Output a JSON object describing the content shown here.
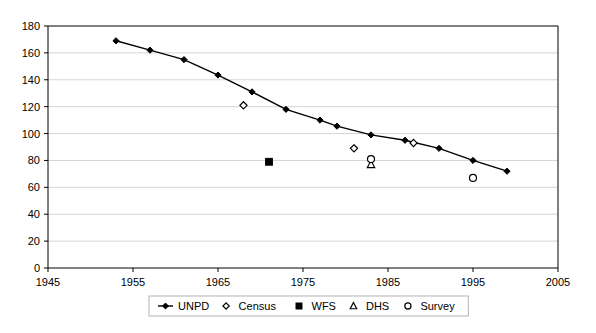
{
  "chart_data": {
    "type": "scatter",
    "title": "",
    "subtitle": "",
    "xlabel": "",
    "ylabel": "",
    "xlim": [
      1945,
      2005
    ],
    "ylim": [
      0,
      180
    ],
    "x_ticks": [
      1945,
      1955,
      1965,
      1975,
      1985,
      1995,
      2005
    ],
    "y_ticks": [
      0,
      20,
      40,
      60,
      80,
      100,
      120,
      140,
      160,
      180
    ],
    "x_tick_labels": [
      "1945",
      "1955",
      "1965",
      "1975",
      "1985",
      "1995",
      "2005"
    ],
    "y_tick_labels": [
      "0",
      "20",
      "40",
      "60",
      "80",
      "100",
      "120",
      "140",
      "160",
      "180"
    ],
    "grid": "horizontal",
    "legend_position": "bottom",
    "series": [
      {
        "name": "UNPD",
        "marker": "filled-diamond",
        "line": true,
        "points": [
          {
            "x": 1953,
            "y": 169
          },
          {
            "x": 1957,
            "y": 162
          },
          {
            "x": 1961,
            "y": 155
          },
          {
            "x": 1965,
            "y": 143.5
          },
          {
            "x": 1969,
            "y": 131
          },
          {
            "x": 1973,
            "y": 118
          },
          {
            "x": 1977,
            "y": 110
          },
          {
            "x": 1979,
            "y": 105.5
          },
          {
            "x": 1983,
            "y": 99
          },
          {
            "x": 1987,
            "y": 95
          },
          {
            "x": 1991,
            "y": 89
          },
          {
            "x": 1995,
            "y": 80
          },
          {
            "x": 1999,
            "y": 72
          }
        ]
      },
      {
        "name": "Census",
        "marker": "open-diamond",
        "line": false,
        "points": [
          {
            "x": 1968,
            "y": 121
          },
          {
            "x": 1981,
            "y": 89
          },
          {
            "x": 1988,
            "y": 93
          }
        ]
      },
      {
        "name": "WFS",
        "marker": "filled-square",
        "line": false,
        "points": [
          {
            "x": 1971,
            "y": 79
          }
        ]
      },
      {
        "name": "DHS",
        "marker": "open-triangle",
        "line": false,
        "points": [
          {
            "x": 1983,
            "y": 77
          }
        ]
      },
      {
        "name": "Survey",
        "marker": "open-circle",
        "line": false,
        "points": [
          {
            "x": 1983,
            "y": 81
          },
          {
            "x": 1995,
            "y": 67
          }
        ]
      }
    ]
  },
  "legend": {
    "items": [
      {
        "label": "UNPD",
        "marker": "filled-diamond-line"
      },
      {
        "label": "Census",
        "marker": "open-diamond"
      },
      {
        "label": "WFS",
        "marker": "filled-square"
      },
      {
        "label": "DHS",
        "marker": "open-triangle"
      },
      {
        "label": "Survey",
        "marker": "open-circle"
      }
    ]
  }
}
